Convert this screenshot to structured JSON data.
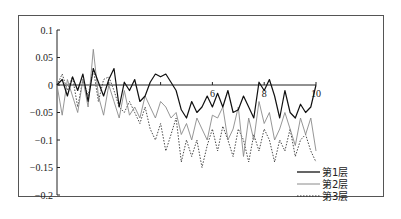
{
  "chart_data": {
    "type": "line",
    "title": "",
    "xlabel": "",
    "ylabel": "",
    "xlim": [
      0,
      10
    ],
    "ylim": [
      -0.2,
      0.1
    ],
    "grid": false,
    "legend_position": "lower right",
    "y_ticks": [
      "0.1",
      "0.05",
      "0",
      "-0.05",
      "-0.1",
      "-0.15",
      "-0.2"
    ],
    "y_tick_values": [
      0.1,
      0.05,
      0,
      -0.05,
      -0.1,
      -0.15,
      -0.2
    ],
    "x_ticks": [
      "6",
      "8",
      "10"
    ],
    "x_tick_values": [
      6,
      8,
      10
    ],
    "x": [
      0,
      0.2,
      0.4,
      0.6,
      0.8,
      1.0,
      1.2,
      1.4,
      1.6,
      1.8,
      2.0,
      2.2,
      2.4,
      2.6,
      2.8,
      3.0,
      3.2,
      3.4,
      3.6,
      3.8,
      4.0,
      4.2,
      4.4,
      4.6,
      4.8,
      5.0,
      5.2,
      5.4,
      5.6,
      5.8,
      6.0,
      6.2,
      6.4,
      6.6,
      6.8,
      7.0,
      7.2,
      7.4,
      7.6,
      7.8,
      8.0,
      8.2,
      8.4,
      8.6,
      8.8,
      9.0,
      9.2,
      9.4,
      9.6,
      9.8,
      10.0
    ],
    "series": [
      {
        "name": "第1层",
        "style": "solid-black",
        "values": [
          0,
          0.01,
          -0.02,
          0.015,
          -0.01,
          0.02,
          -0.03,
          0.03,
          0.005,
          -0.02,
          0.01,
          0.03,
          -0.04,
          0.005,
          -0.01,
          0.01,
          -0.03,
          -0.02,
          0.005,
          0.02,
          0.015,
          0.02,
          0.005,
          -0.01,
          -0.045,
          -0.06,
          -0.03,
          -0.05,
          -0.04,
          -0.02,
          -0.04,
          -0.015,
          -0.04,
          -0.01,
          -0.05,
          -0.045,
          -0.02,
          -0.04,
          -0.06,
          0.005,
          -0.01,
          0.01,
          -0.02,
          -0.06,
          -0.01,
          -0.05,
          -0.06,
          -0.035,
          -0.05,
          -0.04,
          0.0
        ]
      },
      {
        "name": "第2层",
        "style": "solid-gray",
        "values": [
          0,
          -0.055,
          0.01,
          -0.02,
          -0.05,
          0.01,
          -0.04,
          0.065,
          -0.02,
          -0.055,
          0.0,
          -0.03,
          -0.06,
          -0.01,
          -0.055,
          -0.04,
          -0.06,
          -0.02,
          -0.04,
          -0.06,
          -0.03,
          -0.04,
          -0.06,
          -0.05,
          -0.09,
          -0.07,
          -0.1,
          -0.06,
          -0.08,
          -0.1,
          -0.055,
          -0.06,
          -0.04,
          -0.1,
          -0.08,
          -0.04,
          -0.13,
          -0.06,
          -0.1,
          -0.03,
          -0.07,
          -0.05,
          -0.1,
          -0.08,
          -0.05,
          -0.08,
          -0.11,
          -0.06,
          -0.09,
          -0.06,
          -0.12
        ]
      },
      {
        "name": "第3层",
        "style": "dotted",
        "values": [
          0,
          0.02,
          -0.01,
          0.015,
          -0.04,
          0.01,
          -0.02,
          0.03,
          -0.03,
          0.01,
          0.015,
          -0.01,
          -0.04,
          -0.05,
          -0.03,
          -0.05,
          -0.07,
          -0.04,
          -0.08,
          -0.1,
          -0.07,
          -0.12,
          -0.09,
          -0.06,
          -0.14,
          -0.1,
          -0.13,
          -0.1,
          -0.15,
          -0.11,
          -0.08,
          -0.12,
          -0.075,
          -0.1,
          -0.13,
          -0.08,
          -0.1,
          -0.14,
          -0.09,
          -0.12,
          -0.08,
          -0.1,
          -0.14,
          -0.1,
          -0.12,
          -0.08,
          -0.13,
          -0.1,
          -0.09,
          -0.12,
          -0.14
        ]
      }
    ]
  },
  "legend": {
    "items": [
      {
        "label": "第1层",
        "color": "#111111",
        "dash": ""
      },
      {
        "label": "第2层",
        "color": "#8a8a8a",
        "dash": ""
      },
      {
        "label": "第3层",
        "color": "#333333",
        "dash": "1.5,1.5"
      }
    ]
  },
  "axes": {
    "y_labels": [
      "0.1",
      "0.05",
      "0",
      "-0.05",
      "-0.1",
      "-0.15",
      "-0.2"
    ],
    "x_labels": [
      "6",
      "8",
      "10"
    ]
  }
}
